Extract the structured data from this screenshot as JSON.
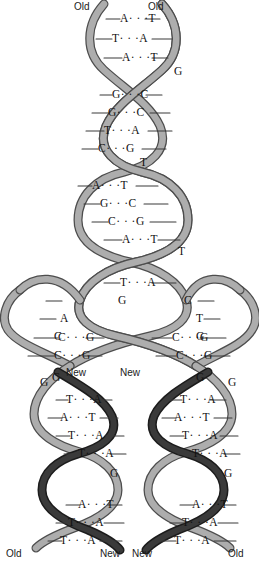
{
  "figure": {
    "colors": {
      "background": "#ffffff",
      "old_strand": "#a8a8a8",
      "old_strand_edge": "#4d4d4d",
      "new_strand": "#2b2b2b",
      "rung_line": "#3a3a3a",
      "text": "#111111"
    }
  },
  "labels": {
    "top_left": "Old",
    "top_right": "Old",
    "fork_left_new": "New",
    "fork_right_new": "New",
    "bottom_left_outer": "Old",
    "bottom_left_inner": "New",
    "bottom_right_inner": "New",
    "bottom_right_outer": "Old"
  },
  "parent_helix": {
    "region": "unreplicated parent duplex (top)",
    "base_pairs": [
      {
        "left": "A",
        "right": "T",
        "y": 19
      },
      {
        "left": "T",
        "right": "A",
        "y": 39
      },
      {
        "left": "A",
        "right": "T",
        "y": 58
      },
      {
        "left": "G",
        "right": "C",
        "y": 95
      },
      {
        "left": "G",
        "right": "C",
        "y": 113
      },
      {
        "left": "T",
        "right": "A",
        "y": 131
      },
      {
        "left": "C",
        "right": "G",
        "y": 149
      },
      {
        "left": "A",
        "right": "T",
        "y": 186
      },
      {
        "left": "G",
        "right": "C",
        "y": 204
      },
      {
        "left": "C",
        "right": "G",
        "y": 222
      },
      {
        "left": "A",
        "right": "T",
        "y": 240
      },
      {
        "left": "T",
        "right": "A",
        "y": 283
      }
    ],
    "crossover_bases": [
      {
        "base": "G",
        "y": 73
      },
      {
        "base": "T",
        "y": 163
      },
      {
        "base": "T",
        "y": 252
      }
    ]
  },
  "replication_fork": {
    "region": "unwound single strands at the fork",
    "left_unpaired": [
      "G",
      "A",
      "C"
    ],
    "right_unpaired": [
      "C",
      "T",
      "G"
    ],
    "joined_pairs": [
      {
        "side": "left",
        "left": "C",
        "right": "G",
        "y": 338
      },
      {
        "side": "left",
        "left": "C",
        "right": "G",
        "y": 356
      },
      {
        "side": "right",
        "left": "C",
        "right": "G",
        "y": 338
      },
      {
        "side": "right",
        "left": "C",
        "right": "G",
        "y": 356
      }
    ],
    "fork_bases": [
      {
        "base": "G",
        "side": "left",
        "y": 375
      },
      {
        "base": "G",
        "side": "right",
        "y": 375
      }
    ]
  },
  "daughter_left": {
    "region": "left daughter duplex (old + new strand)",
    "base_pairs": [
      {
        "left": "T",
        "right": "A",
        "y": 400
      },
      {
        "left": "A",
        "right": "T",
        "y": 418
      },
      {
        "left": "T",
        "right": "A",
        "y": 436
      },
      {
        "left": "T",
        "right": "A",
        "y": 454
      },
      {
        "left": "A",
        "right": "T",
        "y": 505
      },
      {
        "left": "T",
        "right": "A",
        "y": 523
      },
      {
        "left": "T",
        "right": "A",
        "y": 541
      }
    ],
    "crossover_bases": [
      {
        "base": "G",
        "y": 383
      },
      {
        "base": "G",
        "y": 474
      }
    ]
  },
  "daughter_right": {
    "region": "right daughter duplex (new + old strand)",
    "base_pairs": [
      {
        "left": "T",
        "right": "A",
        "y": 400
      },
      {
        "left": "A",
        "right": "T",
        "y": 418
      },
      {
        "left": "T",
        "right": "A",
        "y": 436
      },
      {
        "left": "T",
        "right": "A",
        "y": 454
      },
      {
        "left": "A",
        "right": "T",
        "y": 505
      },
      {
        "left": "T",
        "right": "A",
        "y": 523
      },
      {
        "left": "T",
        "right": "A",
        "y": 541
      }
    ],
    "crossover_bases": [
      {
        "base": "G",
        "y": 383
      },
      {
        "base": "G",
        "y": 474
      }
    ]
  },
  "base_pair_glyphs": {
    "hydrogen_bond_dots": "· · ·"
  }
}
